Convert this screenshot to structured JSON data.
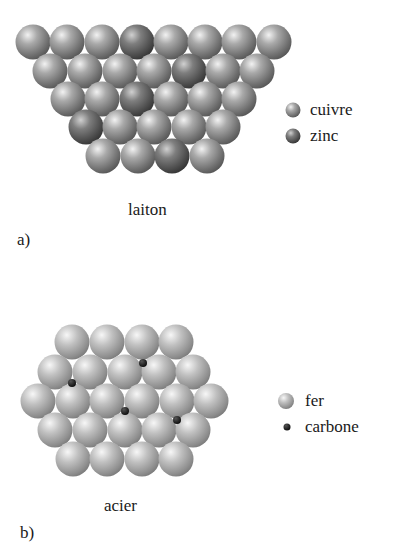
{
  "panels": [
    {
      "id": "a",
      "panel_label": "a)",
      "caption": "laiton",
      "legend": [
        {
          "label": "cuivre",
          "symbol": "copper-atom",
          "color": "#8c8c8c"
        },
        {
          "label": "zinc",
          "symbol": "zinc-atom",
          "color": "#6a6a6a"
        }
      ]
    },
    {
      "id": "b",
      "panel_label": "b)",
      "caption": "acier",
      "legend": [
        {
          "label": "fer",
          "symbol": "iron-atom",
          "color": "#9a9a9a"
        },
        {
          "label": "carbone",
          "symbol": "carbon-atom",
          "color": "#111111"
        }
      ]
    }
  ],
  "brass_lattice": {
    "radius": 17.5,
    "rows": [
      {
        "y": 42,
        "x": [
          33,
          67,
          102,
          137,
          171,
          205,
          239,
          274
        ],
        "zinc_index": [
          3
        ]
      },
      {
        "y": 71,
        "x": [
          50,
          85,
          120,
          154,
          189,
          223,
          257
        ],
        "zinc_index": [
          4
        ]
      },
      {
        "y": 99,
        "x": [
          68,
          102,
          137,
          171,
          205,
          239
        ],
        "zinc_index": [
          2
        ]
      },
      {
        "y": 127,
        "x": [
          86,
          120,
          154,
          189,
          223
        ],
        "zinc_index": [
          0
        ]
      },
      {
        "y": 156,
        "x": [
          103,
          138,
          172,
          207
        ],
        "zinc_index": [
          2
        ]
      }
    ]
  },
  "steel_lattice": {
    "radius": 17.5,
    "rows": [
      {
        "y": 342,
        "x": [
          72,
          107,
          142,
          176
        ]
      },
      {
        "y": 372,
        "x": [
          55,
          90,
          125,
          159,
          193
        ]
      },
      {
        "y": 401,
        "x": [
          38,
          73,
          107,
          142,
          177,
          211
        ]
      },
      {
        "y": 430,
        "x": [
          55,
          90,
          125,
          159,
          193
        ]
      },
      {
        "y": 459,
        "x": [
          73,
          107,
          142,
          176
        ]
      }
    ],
    "carbon_atoms": [
      {
        "x": 143,
        "y": 363
      },
      {
        "x": 72,
        "y": 383
      },
      {
        "x": 125,
        "y": 411
      },
      {
        "x": 177,
        "y": 420
      }
    ]
  }
}
